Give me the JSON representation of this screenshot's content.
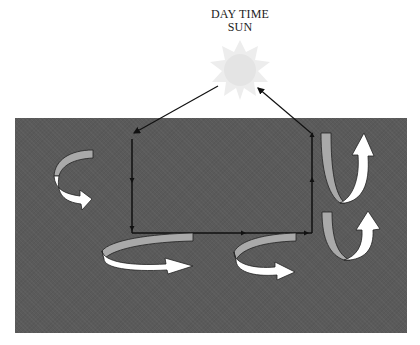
{
  "diagram": {
    "title_line1": "DAY TIME",
    "title_line2": "SUN",
    "colors": {
      "background": "#ffffff",
      "ground": "#5a5a5a",
      "sun": "#eeeeee",
      "ribbon_back": "#a9a9a9",
      "ribbon_front": "#ffffff",
      "lines": "#111111"
    },
    "elements": [
      {
        "id": "sun",
        "type": "sun-shape"
      },
      {
        "id": "ground",
        "type": "dark-rectangle"
      },
      {
        "id": "circuit",
        "type": "rectangular-flow-loop",
        "direction": "down-left-side, right-bottom, up-right-side"
      },
      {
        "id": "sun-to-left",
        "type": "arrow",
        "from": "sun",
        "to": "circuit-top-left"
      },
      {
        "id": "right-to-sun",
        "type": "arrow",
        "from": "circuit-top-right",
        "to": "sun"
      },
      {
        "id": "swirl-left",
        "type": "curved-arrow",
        "position": "left"
      },
      {
        "id": "swirl-bottom-left",
        "type": "curved-arrow",
        "position": "bottom-left"
      },
      {
        "id": "swirl-bottom-middle",
        "type": "curved-arrow",
        "position": "bottom-middle"
      },
      {
        "id": "uturn-top-right",
        "type": "u-turn-arrow",
        "position": "right-upper"
      },
      {
        "id": "uturn-bottom-right",
        "type": "u-turn-arrow",
        "position": "right-lower"
      }
    ]
  }
}
